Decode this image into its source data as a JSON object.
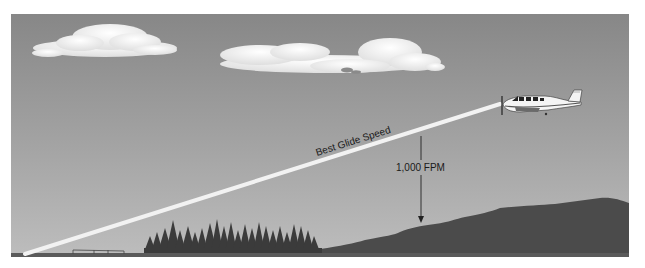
{
  "diagram": {
    "labels": {
      "glide_path": "Best Glide Speed",
      "descent_rate": "1,000 FPM"
    },
    "colors": {
      "sky_top": "#8a8a8a",
      "sky_bottom": "#b8b8b8",
      "glide_path": "#f2f2f2",
      "terrain": "#4a4a4a",
      "trees": "#3a3a3a",
      "cloud": "#f0f0f0"
    },
    "elements": [
      "clouds",
      "airplane",
      "glide-path",
      "descent-arrow",
      "trees",
      "hill",
      "runway"
    ]
  }
}
